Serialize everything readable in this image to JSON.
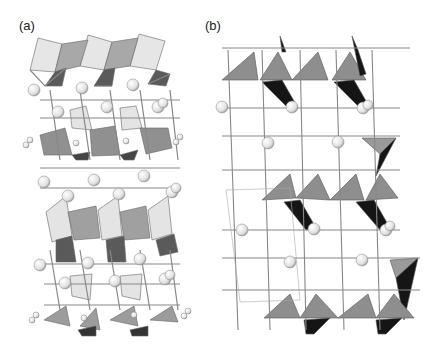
{
  "figure": {
    "panels": [
      {
        "id": "a",
        "label": "(a)"
      },
      {
        "id": "b",
        "label": "(b)"
      }
    ],
    "colors": {
      "background": "#ffffff",
      "light_polyhedron": "#e4e4e4",
      "mid_polyhedron": "#9a9a9a",
      "dark_polyhedron": "#6e6e6e",
      "black_face": "#1a1a1a",
      "bond": "#f4f4f4",
      "bond_outline": "#777777",
      "atom": "#f2f2f2",
      "atom_outline": "#888888"
    }
  }
}
